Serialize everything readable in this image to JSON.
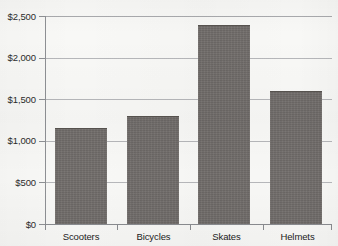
{
  "chart_data": {
    "type": "bar",
    "title": "",
    "subtitle": "",
    "xlabel": "",
    "ylabel": "",
    "categories": [
      "Scooters",
      "Bicycles",
      "Skates",
      "Helmets"
    ],
    "values": [
      1150,
      1300,
      2390,
      1600
    ],
    "series": [
      {
        "name": "Sales",
        "values": [
          1150,
          1300,
          2390,
          1600
        ]
      }
    ],
    "ylim": [
      0,
      2500
    ],
    "ytick_values": [
      0,
      500,
      1000,
      1500,
      2000,
      2500
    ],
    "ytick_labels": [
      "$0",
      "$500",
      "$1,000",
      "$1,500",
      "$2,000",
      "$2,500"
    ],
    "grid": true,
    "grid_axis": "y",
    "legend": false,
    "legend_position": "none",
    "annotations": [],
    "bar_color": "#706c69",
    "gridline_color": "#b6b7ba",
    "axis_color": "#8a8c90",
    "background_color": "#f8f8f6",
    "text_color": "#222222"
  }
}
